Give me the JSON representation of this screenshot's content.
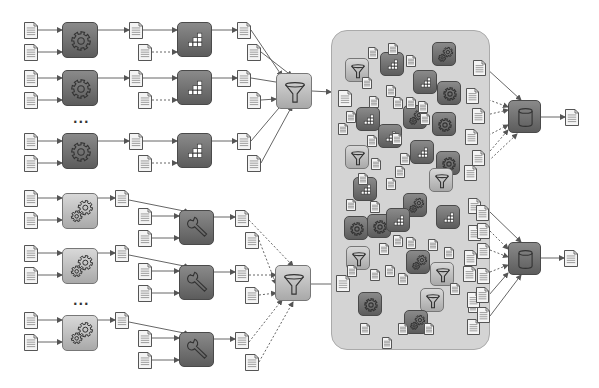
{
  "diagram": {
    "colors": {
      "background": "#ffffff",
      "pool_fill": "#d4d4d4",
      "dark_box": "#6e6e6e",
      "light_box": "#c4c4c4",
      "doc_fill": "#f2f2f2",
      "stroke": "#555555"
    },
    "ellipsis_label": "...",
    "upper_pipeline": {
      "stage1": {
        "icon": "gear-icon",
        "count_visible": 3,
        "has_ellipsis": true
      },
      "stage2": {
        "icon": "blocks-icon",
        "count_visible": 3
      },
      "merge": {
        "icon": "funnel-icon"
      }
    },
    "lower_pipeline": {
      "stage1": {
        "icon": "gears-icon",
        "count_visible": 3,
        "has_ellipsis": true
      },
      "stage2": {
        "icon": "wrench-icon",
        "count_visible": 3
      },
      "merge": {
        "icon": "funnel-icon"
      }
    },
    "pool": {
      "label": "shared data pool",
      "contains": [
        "funnel-icon",
        "blocks-icon",
        "gear-icon",
        "gears-icon",
        "document-icon"
      ]
    },
    "outputs": [
      {
        "icon": "database-icon",
        "result": "document-icon"
      },
      {
        "icon": "database-icon",
        "result": "document-icon"
      }
    ]
  }
}
